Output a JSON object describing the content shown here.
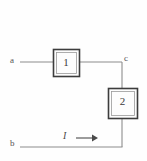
{
  "diagram": {
    "type": "two-port-block-circuit",
    "background_color": "#fefefe",
    "line_color": "#8c8c8c",
    "box_stroke_color": "#3d3d3d",
    "text_color": "#4a4a4a",
    "terminals": [
      {
        "id": "a",
        "label": "a",
        "x": 11,
        "y": 62
      },
      {
        "id": "b",
        "label": "b",
        "x": 11,
        "y": 147
      },
      {
        "id": "c",
        "label": "c",
        "x": 124,
        "y": 59
      }
    ],
    "blocks": [
      {
        "id": "block-1",
        "label": "1",
        "x": 53,
        "y": 49,
        "width": 26,
        "height": 27
      },
      {
        "id": "block-2",
        "label": "2",
        "x": 108,
        "y": 88,
        "width": 29,
        "height": 30
      }
    ],
    "current": {
      "label": "I",
      "arrow_direction": "right",
      "arrow_x_start": 76,
      "arrow_x_end": 97,
      "arrow_y": 138
    },
    "wires": [
      {
        "id": "wire-a-to-block1",
        "points": "20,62 53,62"
      },
      {
        "id": "wire-block1-to-c",
        "points": "79,62 122,62"
      },
      {
        "id": "wire-c-to-block2",
        "points": "122,62 122,88"
      },
      {
        "id": "wire-block2-to-bottom",
        "points": "122,118 122,147"
      },
      {
        "id": "wire-b-to-corner",
        "points": "20,147 122,147"
      }
    ]
  }
}
